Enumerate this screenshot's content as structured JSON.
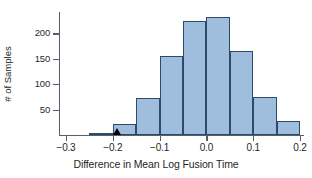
{
  "chart_data": {
    "type": "bar",
    "title": "",
    "subtitle": "",
    "xlabel": "Difference in Mean Log Fusion Time",
    "ylabel": "# of Samples",
    "grid": false,
    "legend": null,
    "xlim": [
      -0.3,
      0.2
    ],
    "ylim": [
      0,
      240
    ],
    "bin_width": 0.05,
    "xticks": [
      -0.3,
      -0.2,
      -0.1,
      0.0,
      0.1,
      0.2
    ],
    "xtick_labels": [
      "−0.3",
      "−0.2",
      "−0.1",
      "0.0",
      "0.1",
      "0.2"
    ],
    "yticks": [
      50,
      100,
      150,
      200
    ],
    "ytick_labels": [
      "50",
      "100",
      "150",
      "200"
    ],
    "bins": [
      {
        "left": -0.25,
        "right": -0.2,
        "value": 4
      },
      {
        "left": -0.2,
        "right": -0.15,
        "value": 22
      },
      {
        "left": -0.15,
        "right": -0.1,
        "value": 73
      },
      {
        "left": -0.1,
        "right": -0.05,
        "value": 155
      },
      {
        "left": -0.05,
        "right": 0.0,
        "value": 225
      },
      {
        "left": 0.0,
        "right": 0.05,
        "value": 232
      },
      {
        "left": 0.05,
        "right": 0.1,
        "value": 165
      },
      {
        "left": 0.1,
        "right": 0.15,
        "value": 75
      },
      {
        "left": 0.15,
        "right": 0.2,
        "value": 28
      }
    ],
    "categories": [
      "-0.25",
      "-0.20",
      "-0.15",
      "-0.10",
      "-0.05",
      "0.00",
      "0.05",
      "0.10",
      "0.15"
    ],
    "values": [
      4,
      22,
      73,
      155,
      225,
      232,
      165,
      75,
      28
    ],
    "annotations": [
      {
        "name": "observed-value-marker",
        "shape": "triangle",
        "x": -0.19,
        "y": 0,
        "color": "#000000"
      }
    ],
    "colors": {
      "bar_fill": "#9fbddc",
      "bar_edge": "#2d4a6b",
      "axis": "#55606b",
      "text": "#1f1f1f",
      "background": "#ffffff"
    }
  }
}
